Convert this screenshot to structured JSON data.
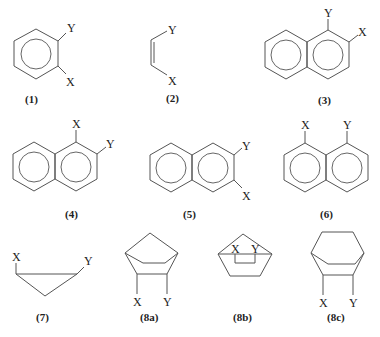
{
  "substituents": {
    "x": "X",
    "y": "Y"
  },
  "structures": [
    {
      "id": "1",
      "label": "(1)",
      "name": "1,2-disubstituted benzene",
      "top": "Y",
      "bottom": "X"
    },
    {
      "id": "2",
      "label": "(2)",
      "name": "cis-alkene",
      "top": "Y",
      "bottom": "X"
    },
    {
      "id": "3",
      "label": "(3)",
      "name": "1,2-disubstituted naphthalene",
      "c1": "Y",
      "c2": "X"
    },
    {
      "id": "4",
      "label": "(4)",
      "name": "1,2-disubstituted naphthalene",
      "c1": "X",
      "c2": "Y"
    },
    {
      "id": "5",
      "label": "(5)",
      "name": "2,3-disubstituted naphthalene",
      "top": "Y",
      "bottom": "X"
    },
    {
      "id": "6",
      "label": "(6)",
      "name": "1,8-disubstituted naphthalene",
      "left": "X",
      "right": "Y"
    },
    {
      "id": "7",
      "label": "(7)",
      "name": "cyclopropane",
      "left": "X",
      "right": "Y"
    },
    {
      "id": "8a",
      "label": "(8a)",
      "name": "norbornane exo",
      "left": "X",
      "right": "Y"
    },
    {
      "id": "8b",
      "label": "(8b)",
      "name": "norbornane endo",
      "left": "X",
      "right": "Y"
    },
    {
      "id": "8c",
      "label": "(8c)",
      "name": "bicyclo[2.2.2]octane",
      "left": "X",
      "right": "Y"
    }
  ]
}
